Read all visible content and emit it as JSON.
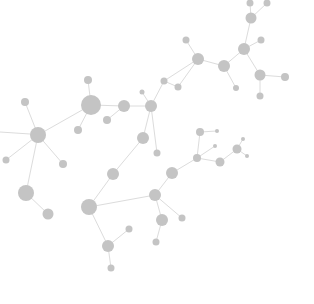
{
  "graphic": {
    "description": "molecular-network-illustration",
    "background": "#ffffff",
    "node_color": "#c4c4c4",
    "edge_color": "#dcdcdc",
    "nodes": [
      {
        "id": "n1",
        "x": 91,
        "y": 105,
        "r": 10
      },
      {
        "id": "n2",
        "x": 124,
        "y": 106,
        "r": 6
      },
      {
        "id": "n3",
        "x": 151,
        "y": 106,
        "r": 6
      },
      {
        "id": "n4",
        "x": 88,
        "y": 80,
        "r": 4
      },
      {
        "id": "n5",
        "x": 38,
        "y": 135,
        "r": 8
      },
      {
        "id": "n6",
        "x": 25,
        "y": 102,
        "r": 4
      },
      {
        "id": "n7",
        "x": 63,
        "y": 164,
        "r": 4
      },
      {
        "id": "n8",
        "x": 107,
        "y": 120,
        "r": 4
      },
      {
        "id": "n9",
        "x": 78,
        "y": 130,
        "r": 4
      },
      {
        "id": "n10",
        "x": 26,
        "y": 193,
        "r": 8
      },
      {
        "id": "n11",
        "x": 48,
        "y": 214,
        "r": 5.5
      },
      {
        "id": "n12",
        "x": 89,
        "y": 207,
        "r": 8
      },
      {
        "id": "n13",
        "x": 113,
        "y": 174,
        "r": 6
      },
      {
        "id": "n14",
        "x": 108,
        "y": 246,
        "r": 6
      },
      {
        "id": "n15",
        "x": 129,
        "y": 229,
        "r": 3.5
      },
      {
        "id": "n16",
        "x": 111,
        "y": 268,
        "r": 3.5
      },
      {
        "id": "n17",
        "x": 155,
        "y": 195,
        "r": 6
      },
      {
        "id": "n18",
        "x": 143,
        "y": 138,
        "r": 6
      },
      {
        "id": "n19",
        "x": 162,
        "y": 220,
        "r": 6
      },
      {
        "id": "n20",
        "x": 182,
        "y": 218,
        "r": 3.5
      },
      {
        "id": "n21",
        "x": 156,
        "y": 242,
        "r": 3.5
      },
      {
        "id": "n22",
        "x": 172,
        "y": 173,
        "r": 6
      },
      {
        "id": "n23",
        "x": 197,
        "y": 158,
        "r": 4
      },
      {
        "id": "n24",
        "x": 198,
        "y": 59,
        "r": 6
      },
      {
        "id": "n25",
        "x": 224,
        "y": 66,
        "r": 6
      },
      {
        "id": "n26",
        "x": 186,
        "y": 40,
        "r": 3.5
      },
      {
        "id": "n27",
        "x": 164,
        "y": 81,
        "r": 3.5
      },
      {
        "id": "n28",
        "x": 178,
        "y": 87,
        "r": 3.5
      },
      {
        "id": "n29",
        "x": 236,
        "y": 88,
        "r": 3
      },
      {
        "id": "n30",
        "x": 244,
        "y": 49,
        "r": 6
      },
      {
        "id": "n31",
        "x": 261,
        "y": 40,
        "r": 3.5
      },
      {
        "id": "n32",
        "x": 260,
        "y": 75,
        "r": 5.5
      },
      {
        "id": "n33",
        "x": 285,
        "y": 77,
        "r": 4
      },
      {
        "id": "n34",
        "x": 260,
        "y": 96,
        "r": 3.5
      },
      {
        "id": "n35",
        "x": 251,
        "y": 18,
        "r": 5.5
      },
      {
        "id": "n36",
        "x": 250,
        "y": 3,
        "r": 3.5
      },
      {
        "id": "n37",
        "x": 267,
        "y": 3,
        "r": 3.5
      },
      {
        "id": "n38",
        "x": 200,
        "y": 132,
        "r": 4
      },
      {
        "id": "n39",
        "x": 217,
        "y": 131,
        "r": 2
      },
      {
        "id": "n40",
        "x": 215,
        "y": 146,
        "r": 2
      },
      {
        "id": "n41",
        "x": 220,
        "y": 162,
        "r": 4.5
      },
      {
        "id": "n42",
        "x": 237,
        "y": 149,
        "r": 4.5
      },
      {
        "id": "n43",
        "x": 243,
        "y": 139,
        "r": 2
      },
      {
        "id": "n44",
        "x": 247,
        "y": 156,
        "r": 2
      },
      {
        "id": "n45",
        "x": 157,
        "y": 153,
        "r": 3.5
      },
      {
        "id": "n46",
        "x": 142,
        "y": 92,
        "r": 2.5
      },
      {
        "id": "n47",
        "x": 6,
        "y": 160,
        "r": 3.5
      }
    ],
    "edges": [
      [
        "n1",
        "n2"
      ],
      [
        "n2",
        "n3"
      ],
      [
        "n1",
        "n4"
      ],
      [
        "n1",
        "n5"
      ],
      [
        "n1",
        "n9"
      ],
      [
        "n2",
        "n8"
      ],
      [
        "n5",
        "n6"
      ],
      [
        "n5",
        "n7"
      ],
      [
        "n5",
        "n10"
      ],
      [
        "n10",
        "n11"
      ],
      [
        "n3",
        "n46"
      ],
      [
        "n3",
        "n45"
      ],
      [
        "n3",
        "n18"
      ],
      [
        "n18",
        "n13"
      ],
      [
        "n13",
        "n12"
      ],
      [
        "n12",
        "n17"
      ],
      [
        "n12",
        "n14"
      ],
      [
        "n14",
        "n15"
      ],
      [
        "n14",
        "n16"
      ],
      [
        "n17",
        "n22"
      ],
      [
        "n17",
        "n19"
      ],
      [
        "n17",
        "n20"
      ],
      [
        "n19",
        "n21"
      ],
      [
        "n22",
        "n23"
      ],
      [
        "n3",
        "n27"
      ],
      [
        "n27",
        "n28"
      ],
      [
        "n28",
        "n24"
      ],
      [
        "n24",
        "n26"
      ],
      [
        "n24",
        "n25"
      ],
      [
        "n25",
        "n29"
      ],
      [
        "n25",
        "n30"
      ],
      [
        "n30",
        "n31"
      ],
      [
        "n30",
        "n32"
      ],
      [
        "n32",
        "n33"
      ],
      [
        "n32",
        "n34"
      ],
      [
        "n30",
        "n35"
      ],
      [
        "n35",
        "n36"
      ],
      [
        "n35",
        "n37"
      ],
      [
        "n38",
        "n39"
      ],
      [
        "n38",
        "n23"
      ],
      [
        "n23",
        "n40"
      ],
      [
        "n23",
        "n41"
      ],
      [
        "n41",
        "n42"
      ],
      [
        "n42",
        "n43"
      ],
      [
        "n42",
        "n44"
      ],
      [
        "n5",
        "n47"
      ],
      [
        "n27",
        "n24"
      ]
    ],
    "stray_edges": [
      {
        "x1": 0,
        "y1": 132,
        "x2": 30,
        "y2": 134
      }
    ]
  }
}
